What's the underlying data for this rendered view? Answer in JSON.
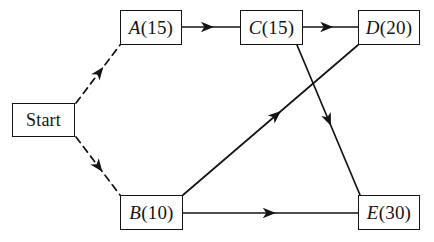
{
  "diagram": {
    "background_color": "#ffffff",
    "line_color": "#141414",
    "nodes": [
      {
        "key": "start",
        "id": "Start",
        "duration": "",
        "label": "Start",
        "x": 12,
        "y": 103,
        "w": 63,
        "h": 34,
        "style": "plain"
      },
      {
        "key": "a",
        "id": "A",
        "duration": "(15)",
        "label": "A(15)",
        "x": 120,
        "y": 10,
        "w": 62,
        "h": 35,
        "style": "activity"
      },
      {
        "key": "c",
        "id": "C",
        "duration": "(15)",
        "label": "C(15)",
        "x": 240,
        "y": 10,
        "w": 63,
        "h": 35,
        "style": "activity"
      },
      {
        "key": "d",
        "id": "D",
        "duration": "(20)",
        "label": "D(20)",
        "x": 358,
        "y": 10,
        "w": 62,
        "h": 35,
        "style": "activity"
      },
      {
        "key": "b",
        "id": "B",
        "duration": "(10)",
        "label": "B(10)",
        "x": 120,
        "y": 195,
        "w": 63,
        "h": 35,
        "style": "activity"
      },
      {
        "key": "e",
        "id": "E",
        "duration": "(30)",
        "label": "E(30)",
        "x": 358,
        "y": 195,
        "w": 62,
        "h": 35,
        "style": "activity"
      }
    ],
    "edges": [
      {
        "key": "start-a",
        "from": "Start",
        "to": "A",
        "style": "dashed",
        "x1": 76,
        "y1": 103,
        "x2": 120,
        "y2": 45,
        "arrow_at": 0.62
      },
      {
        "key": "start-b",
        "from": "Start",
        "to": "B",
        "style": "dashed",
        "x1": 76,
        "y1": 137,
        "x2": 120,
        "y2": 195,
        "arrow_at": 0.6
      },
      {
        "key": "a-c",
        "from": "A",
        "to": "C",
        "style": "solid",
        "x1": 182,
        "y1": 27,
        "x2": 240,
        "y2": 27,
        "arrow_at": 0.55
      },
      {
        "key": "c-d",
        "from": "C",
        "to": "D",
        "style": "solid",
        "x1": 303,
        "y1": 27,
        "x2": 358,
        "y2": 27,
        "arrow_at": 0.55
      },
      {
        "key": "c-e",
        "from": "C",
        "to": "E",
        "style": "solid",
        "x1": 297,
        "y1": 45,
        "x2": 360,
        "y2": 195,
        "arrow_at": 0.54
      },
      {
        "key": "b-d",
        "from": "B",
        "to": "D",
        "style": "solid",
        "x1": 183,
        "y1": 195,
        "x2": 358,
        "y2": 45,
        "arrow_at": 0.56
      },
      {
        "key": "b-e",
        "from": "B",
        "to": "E",
        "style": "solid",
        "x1": 183,
        "y1": 213,
        "x2": 358,
        "y2": 213,
        "arrow_at": 0.53
      }
    ]
  }
}
